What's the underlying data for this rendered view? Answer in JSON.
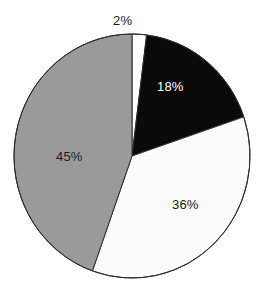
{
  "chart_data": {
    "type": "pie",
    "title": "",
    "subtitle": "",
    "xlabel": "",
    "ylabel": "",
    "legend": "none",
    "grid": false,
    "start_angle_deg": -90,
    "direction": "clockwise",
    "categories": [
      "2%",
      "18%",
      "36%",
      "45%"
    ],
    "values": [
      2,
      18,
      36,
      45
    ],
    "labels": [
      "2%",
      "18%",
      "36%",
      "45%"
    ],
    "slices": [
      {
        "label": "2%",
        "value": 2,
        "fill": "#ffffff",
        "stroke": "#2b2b2b",
        "label_color": "#1c1c1c",
        "label_position": "outside-top"
      },
      {
        "label": "18%",
        "value": 18,
        "fill": "#0a0a0a",
        "stroke": "#2b2b2b",
        "label_color": "#ffffff",
        "label_position": "inside"
      },
      {
        "label": "36%",
        "value": 36,
        "fill": "#fbfbfb",
        "stroke": "#2b2b2b",
        "label_color": "#1c1c1c",
        "label_position": "inside"
      },
      {
        "label": "45%",
        "value": 45,
        "fill": "#9a9a9a",
        "stroke": "#2b2b2b",
        "label_color": "#1c1c1c",
        "label_position": "inside"
      }
    ],
    "geometry": {
      "center_x": 132,
      "center_y": 156,
      "radius_x": 118,
      "radius_y": 122
    },
    "colors": {
      "background": "#ffffff",
      "outline": "#2b2b2b",
      "gray_slice": "#9a9a9a",
      "black_slice": "#0a0a0a",
      "white_slice": "#fbfbfb"
    }
  }
}
